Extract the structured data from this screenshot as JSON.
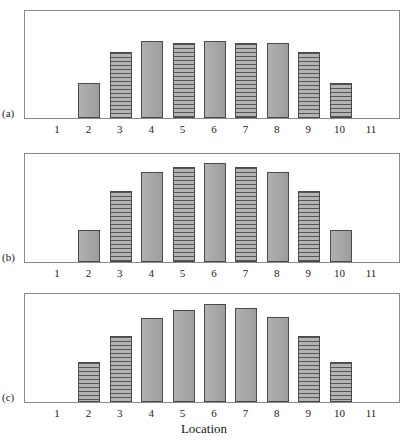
{
  "figure": {
    "axis_title": "Location",
    "tick_labels": [
      "1",
      "2",
      "3",
      "4",
      "5",
      "6",
      "7",
      "8",
      "9",
      "10",
      "11"
    ],
    "panel_labels": [
      "(a)",
      "(b)",
      "(c)"
    ],
    "colors": {
      "bar_fill": "#a9a9a9",
      "bar_border": "#4a4a4a",
      "hatch_line": "#555555",
      "frame": "#8a8a8a",
      "background": "#ffffff",
      "text": "#1a1a1a"
    }
  },
  "chart_data": [
    {
      "type": "bar",
      "title": "(a)",
      "xlabel": "Location",
      "ylabel": "",
      "grid": false,
      "legend": "none",
      "categories": [
        "1",
        "2",
        "3",
        "4",
        "5",
        "6",
        "7",
        "8",
        "9",
        "10",
        "11"
      ],
      "values": [
        0,
        33,
        62,
        72,
        70,
        72,
        70,
        70,
        62,
        33,
        0
      ],
      "ylim": [
        0,
        100
      ],
      "bar_styles": [
        "none",
        "solid",
        "hatched",
        "solid",
        "hatched",
        "solid",
        "hatched",
        "solid",
        "hatched",
        "hatched",
        "none"
      ]
    },
    {
      "type": "bar",
      "title": "(b)",
      "xlabel": "Location",
      "ylabel": "",
      "grid": false,
      "legend": "none",
      "categories": [
        "1",
        "2",
        "3",
        "4",
        "5",
        "6",
        "7",
        "8",
        "9",
        "10",
        "11"
      ],
      "values": [
        0,
        30,
        66,
        83,
        88,
        92,
        88,
        83,
        66,
        30,
        0
      ],
      "ylim": [
        0,
        100
      ],
      "bar_styles": [
        "none",
        "solid",
        "hatched",
        "solid",
        "hatched",
        "solid",
        "hatched",
        "solid",
        "hatched",
        "solid",
        "none"
      ]
    },
    {
      "type": "bar",
      "title": "(c)",
      "xlabel": "Location",
      "ylabel": "",
      "grid": false,
      "legend": "none",
      "categories": [
        "1",
        "2",
        "3",
        "4",
        "5",
        "6",
        "7",
        "8",
        "9",
        "10",
        "11"
      ],
      "values": [
        0,
        37,
        61,
        78,
        85,
        91,
        87,
        79,
        61,
        37,
        0
      ],
      "ylim": [
        0,
        100
      ],
      "bar_styles": [
        "none",
        "hatched",
        "hatched",
        "solid",
        "solid",
        "solid",
        "solid",
        "solid",
        "hatched",
        "hatched",
        "none"
      ]
    }
  ]
}
